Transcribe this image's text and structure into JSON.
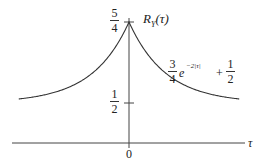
{
  "chart_data": {
    "type": "line",
    "title": "",
    "xlabel": "τ",
    "ylabel": "R_Y(τ)",
    "function_label": {
      "coef_num": "3",
      "coef_den": "4",
      "exp_base": "e",
      "exp_power": "−2|τ|",
      "plus": "+",
      "const_num": "1",
      "const_den": "2"
    },
    "y_ticks": [
      {
        "value": 1.25,
        "num": "5",
        "den": "4"
      },
      {
        "value": 0.5,
        "num": "1",
        "den": "2"
      }
    ],
    "x_ticks": [
      {
        "value": 0,
        "label": "0"
      }
    ],
    "xlim": [
      -1.5,
      1.5
    ],
    "ylim_display": [
      0.5,
      1.25
    ],
    "grid": false,
    "series": [
      {
        "name": "R_Y(τ) = 3/4 e^(−2|τ|) + 1/2",
        "x": [
          -1.5,
          -1.25,
          -1.0,
          -0.75,
          -0.5,
          -0.25,
          -0.1,
          0,
          0.1,
          0.25,
          0.5,
          0.75,
          1.0,
          1.25,
          1.5
        ],
        "values": [
          0.537,
          0.562,
          0.601,
          0.667,
          0.776,
          0.955,
          1.114,
          1.25,
          1.114,
          0.955,
          0.776,
          0.667,
          0.601,
          0.562,
          0.537
        ]
      }
    ]
  },
  "labels": {
    "y_axis_name": "R",
    "y_axis_sub": "Y",
    "y_axis_arg": "(τ)",
    "x_axis_name": "τ",
    "origin": "0"
  },
  "colors": {
    "line": "#333333",
    "axis": "#444444"
  }
}
